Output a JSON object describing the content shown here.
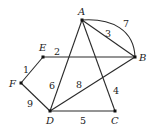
{
  "graph": {
    "nodes": [
      {
        "id": "A",
        "label": "A",
        "x": 82,
        "y": 20,
        "lx": 78,
        "ly": 15
      },
      {
        "id": "B",
        "label": "B",
        "x": 135,
        "y": 57,
        "lx": 139,
        "ly": 61
      },
      {
        "id": "C",
        "label": "C",
        "x": 115,
        "y": 111,
        "lx": 111,
        "ly": 124
      },
      {
        "id": "D",
        "label": "D",
        "x": 50,
        "y": 111,
        "lx": 46,
        "ly": 124
      },
      {
        "id": "E",
        "label": "E",
        "x": 43,
        "y": 57,
        "lx": 39,
        "ly": 51
      },
      {
        "id": "F",
        "label": "F",
        "x": 21,
        "y": 83,
        "lx": 9,
        "ly": 87
      }
    ],
    "edges": [
      {
        "from": "F",
        "to": "E",
        "weight": "1",
        "lx": 23,
        "ly": 73
      },
      {
        "from": "E",
        "to": "B",
        "weight": "2",
        "lx": 54,
        "ly": 55
      },
      {
        "from": "A",
        "to": "B",
        "weight": "3",
        "lx": 105,
        "ly": 37,
        "type": "straight"
      },
      {
        "from": "A",
        "to": "C",
        "weight": "4",
        "lx": 113,
        "ly": 94
      },
      {
        "from": "D",
        "to": "C",
        "weight": "5",
        "lx": 80,
        "ly": 124
      },
      {
        "from": "A",
        "to": "D",
        "weight": "6",
        "lx": 49,
        "ly": 89
      },
      {
        "from": "A",
        "to": "B",
        "weight": "7",
        "lx": 123,
        "ly": 27,
        "type": "arc"
      },
      {
        "from": "D",
        "to": "B",
        "weight": "8",
        "lx": 76,
        "ly": 88
      },
      {
        "from": "F",
        "to": "D",
        "weight": "9",
        "lx": 27,
        "ly": 107
      }
    ]
  }
}
